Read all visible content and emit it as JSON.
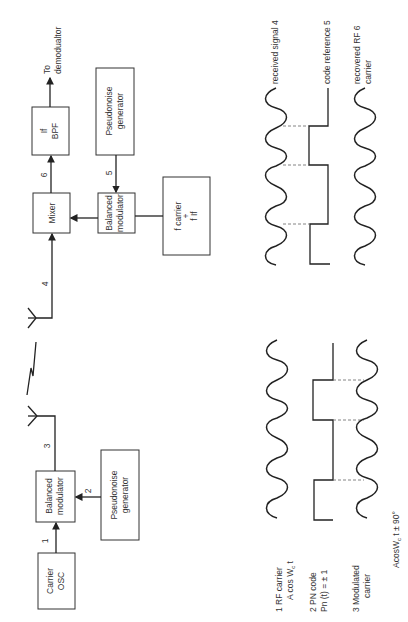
{
  "transmitter": {
    "carrier_osc": [
      "Carrier",
      "OSC"
    ],
    "balanced_modulator": [
      "Balanced",
      "modulator"
    ],
    "pn_generator": [
      "Pseudonoise",
      "generator"
    ],
    "node_labels": {
      "n1": "1",
      "n2": "2",
      "n3": "3"
    }
  },
  "receiver": {
    "mixer": "Mixer",
    "if_bpf": [
      "If",
      "BPF"
    ],
    "balanced_modulator": [
      "Balanced",
      "modulator"
    ],
    "pn_generator": [
      "Pseudonoise",
      "generator"
    ],
    "local_osc": [
      "f carrier",
      "+",
      "f If"
    ],
    "output": [
      "To",
      "demodualtor"
    ],
    "node_labels": {
      "n4": "4",
      "n5": "5",
      "n6": "6"
    }
  },
  "waveforms_tx": {
    "w1_label": [
      "1   RF carrier",
      "A cos W",
      "c",
      " t"
    ],
    "w2_label": [
      "2 PN code",
      "Pn (t) = ± 1"
    ],
    "w3_label": [
      "3   Modulated",
      "carrier"
    ],
    "formula": [
      "AcosW",
      "c",
      " t ± 90°"
    ]
  },
  "waveforms_rx": {
    "w4_label": "received signal 4",
    "w5_label": "code reference 5",
    "w6_label": [
      "recovered RF  6",
      "carrier"
    ]
  }
}
